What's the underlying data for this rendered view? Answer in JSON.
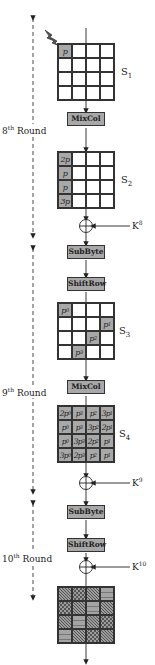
{
  "diagram": {
    "type": "AES fault attack propagation (rounds 8-10)",
    "rounds": [
      {
        "label_num": "8",
        "label_sup": "th",
        "label_text": " Round"
      },
      {
        "label_num": "9",
        "label_sup": "th",
        "label_text": " Round"
      },
      {
        "label_num": "10",
        "label_sup": "th",
        "label_text": " Round"
      }
    ],
    "fault_icon": "lightning-bolt-icon",
    "states": {
      "s1": {
        "name": "S",
        "sub": "1",
        "cells": [
          "p",
          "",
          "",
          "",
          "",
          "",
          "",
          "",
          "",
          "",
          "",
          "",
          "",
          "",
          "",
          ""
        ],
        "faulty": [
          0
        ]
      },
      "s2": {
        "name": "S",
        "sub": "2",
        "cells": [
          "2p",
          "",
          "",
          "",
          "p",
          "",
          "",
          "",
          "p",
          "",
          "",
          "",
          "3p",
          "",
          "",
          ""
        ],
        "faulty": [
          0,
          4,
          8,
          12
        ]
      },
      "s3": {
        "name": "S",
        "sub": "3",
        "cells": [
          "p0",
          "",
          "",
          "",
          "",
          "",
          "",
          "p1",
          "",
          "",
          "p2",
          "",
          "",
          "p3",
          "",
          ""
        ],
        "faulty": [
          0,
          7,
          10,
          13
        ]
      },
      "s4": {
        "name": "S",
        "sub": "4",
        "cells": [
          "2p0",
          "p3",
          "p2",
          "3p1",
          "p0",
          "p3",
          "3p2",
          "2p1",
          "p0",
          "3p3",
          "2p2",
          "p1",
          "3p0",
          "2p3",
          "p2",
          "p1"
        ],
        "faulty": [
          0,
          1,
          2,
          3,
          4,
          5,
          6,
          7,
          8,
          9,
          10,
          11,
          12,
          13,
          14,
          15
        ]
      }
    },
    "operations": {
      "mixcol_8": "MixCol",
      "subbyte_9": "SubByte",
      "shiftrow_9": "ShiftRow",
      "mixcol_9": "MixCol",
      "subbyte_10": "SubByte",
      "shiftrow_10": "ShiftRow"
    },
    "keys": [
      {
        "name": "K",
        "sup": "8"
      },
      {
        "name": "K",
        "sup": "9"
      },
      {
        "name": "K",
        "sup": "10"
      }
    ],
    "output_patterns": [
      "diag",
      "cross",
      "diag",
      "wave",
      "cross",
      "diag",
      "wave",
      "diag",
      "diag",
      "wave",
      "diag",
      "cross",
      "wave",
      "diag",
      "cross",
      "diag"
    ],
    "colors": {
      "faulty_fill": "#a8a8a8",
      "line": "#333333"
    }
  }
}
